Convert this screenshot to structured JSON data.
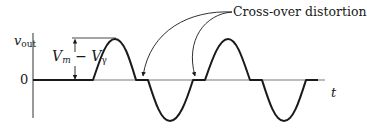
{
  "figure": {
    "y_axis_label": "v",
    "y_axis_subscript": "out",
    "zero_label": "0",
    "x_axis_label": "t",
    "amplitude_label": {
      "v": "V",
      "m_sub": "m",
      "minus": "−",
      "v2": "V",
      "gamma_sub": "γ"
    },
    "annotation": "Cross-over distortion",
    "colors": {
      "stroke": "#1a1a1a",
      "axis": "#333333",
      "background": "#ffffff"
    }
  },
  "waveform": {
    "description": "Sinusoid with flat dead-zone segments at each zero crossing",
    "cycles": 2,
    "segments": [
      "flat",
      "positive-half",
      "flat",
      "negative-half",
      "flat",
      "positive-half",
      "flat",
      "negative-half",
      "flat"
    ]
  }
}
